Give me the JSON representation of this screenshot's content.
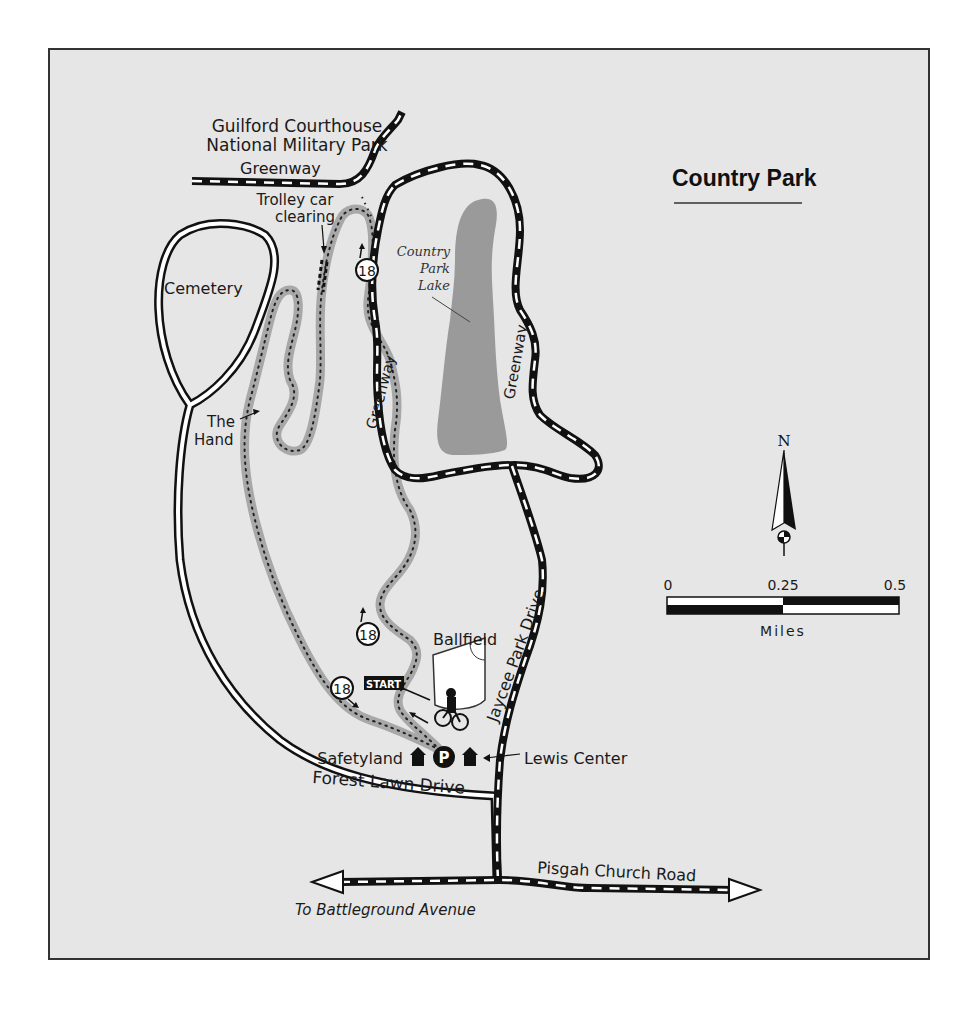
{
  "map": {
    "title": "Country Park",
    "labels": {
      "park_line1": "Guilford Courthouse",
      "park_line2": "National Military Park",
      "greenway_top": "Greenway",
      "trolley_line1": "Trolley car",
      "trolley_line2": "clearing",
      "cemetery": "Cemetery",
      "hand_line1": "The",
      "hand_line2": "Hand",
      "greenway_left": "Greenway",
      "greenway_right": "Greenway",
      "lake_line1": "Country",
      "lake_line2": "Park",
      "lake_line3": "Lake",
      "ballfield": "Ballfield",
      "start": "START",
      "safetyland": "Safetyland",
      "lewis_center": "Lewis Center",
      "forest_lawn": "Forest Lawn Drive",
      "jaycee": "Jaycee Park Drive",
      "pisgah": "Pisgah Church Road",
      "battleground": "To Battleground Avenue"
    },
    "route_markers": [
      "18",
      "18",
      "18"
    ],
    "parking": "P",
    "compass": {
      "label": "N"
    },
    "scale": {
      "ticks": [
        "0",
        "0.25",
        "0.5"
      ],
      "unit": "Miles"
    },
    "colors": {
      "background": "#e6e6e6",
      "lake": "#9a9a9a",
      "trail": "#a8a8a8",
      "road": "#111111"
    }
  }
}
